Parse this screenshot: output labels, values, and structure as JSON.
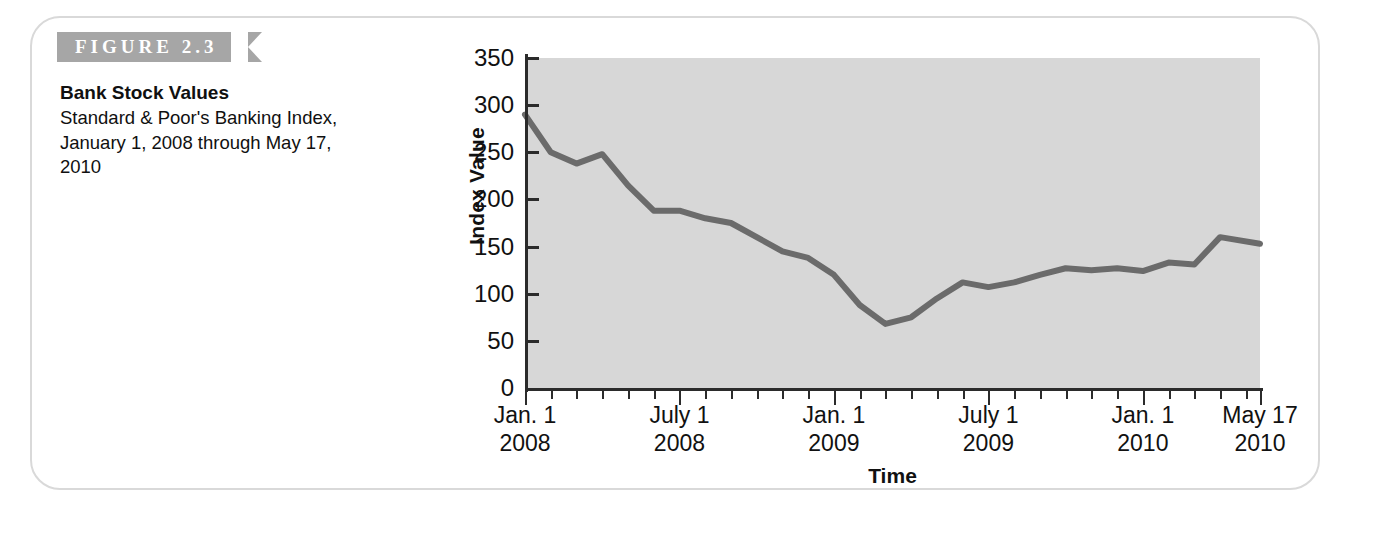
{
  "figure": {
    "banner_label": "FIGURE 2.3",
    "caption_title": "Bank Stock Values",
    "caption_body": "Standard & Poor's Banking Index, January 1, 2008 through May 17, 2010"
  },
  "colors": {
    "banner_background": "#a6a6a6",
    "card_border": "#d9d9d9",
    "plot_background": "#d7d7d7",
    "series_line": "#6b6b6b",
    "axis": "#2b2b2b",
    "text": "#111111"
  },
  "chart_data": {
    "type": "line",
    "title": "Bank Stock Values",
    "subtitle": "Standard & Poor's Banking Index, January 1, 2008 through May 17, 2010",
    "xlabel": "Time",
    "ylabel": "Index Value",
    "ylim": [
      0,
      350
    ],
    "yticks": [
      0,
      50,
      100,
      150,
      200,
      250,
      300,
      350
    ],
    "ytick_labels": [
      "0",
      "50",
      "100",
      "150",
      "200",
      "250",
      "300",
      "350"
    ],
    "grid": false,
    "legend": "none",
    "x_major_ticks": [
      {
        "label_line1": "Jan. 1",
        "label_line2": "2008",
        "x": 0
      },
      {
        "label_line1": "July 1",
        "label_line2": "2008",
        "x": 6
      },
      {
        "label_line1": "Jan. 1",
        "label_line2": "2009",
        "x": 12
      },
      {
        "label_line1": "July 1",
        "label_line2": "2009",
        "x": 18
      },
      {
        "label_line1": "Jan. 1",
        "label_line2": "2010",
        "x": 24
      },
      {
        "label_line1": "May 17",
        "label_line2": "2010",
        "x": 28.55
      }
    ],
    "x_minor_tick_interval_months": 1,
    "x_range_months": [
      0,
      28.55
    ],
    "x_unit": "months since January 1, 2008",
    "series": [
      {
        "name": "S&P Banking Index",
        "x": [
          0,
          1,
          2,
          3,
          4,
          5,
          6,
          7,
          8,
          9,
          10,
          11,
          12,
          13,
          14,
          15,
          16,
          17,
          18,
          19,
          20,
          21,
          22,
          23,
          24,
          25,
          26,
          27,
          28.55
        ],
        "values": [
          290,
          250,
          238,
          248,
          215,
          188,
          188,
          180,
          175,
          160,
          145,
          138,
          120,
          88,
          68,
          75,
          95,
          112,
          107,
          112,
          120,
          127,
          125,
          127,
          124,
          133,
          131,
          160,
          153
        ]
      }
    ]
  }
}
